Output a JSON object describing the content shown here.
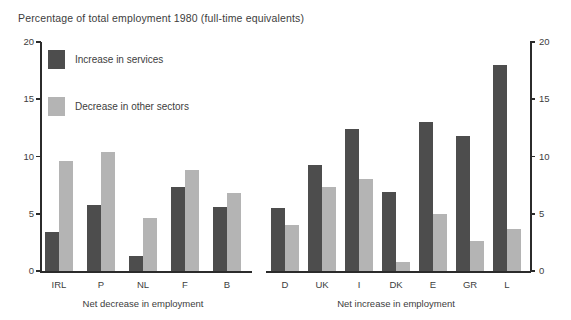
{
  "chart_data": {
    "type": "bar",
    "title": "Percentage of total employment 1980 (full-time equivalents)",
    "xlabel": "",
    "ylabel": "",
    "ylim": [
      0,
      20
    ],
    "yticks": [
      0,
      5,
      10,
      15,
      20
    ],
    "ytick_labels": [
      "0",
      "5",
      "10",
      "15",
      "20"
    ],
    "grid": false,
    "legend_position": "top-left-inside",
    "dual_y_axis": true,
    "categories": [
      "IRL",
      "P",
      "NL",
      "F",
      "B",
      "D",
      "UK",
      "I",
      "DK",
      "E",
      "GR",
      "L"
    ],
    "series": [
      {
        "name": "Increase in services",
        "color": "#4d4d4d",
        "values": [
          3.4,
          5.8,
          1.3,
          7.3,
          5.6,
          5.5,
          9.3,
          12.4,
          6.9,
          13.0,
          11.8,
          18.0
        ]
      },
      {
        "name": "Decrease in other sectors",
        "color": "#b4b4b4",
        "values": [
          9.6,
          10.4,
          4.6,
          8.8,
          6.8,
          4.0,
          7.3,
          8.0,
          0.8,
          5.0,
          2.6,
          3.7
        ]
      }
    ],
    "groups": [
      {
        "label": "Net decrease in employment",
        "categories": [
          "IRL",
          "P",
          "NL",
          "F",
          "B"
        ]
      },
      {
        "label": "Net increase in employment",
        "categories": [
          "D",
          "UK",
          "I",
          "DK",
          "E",
          "GR",
          "L"
        ]
      }
    ]
  },
  "legend": {
    "items": [
      {
        "label": "Increase in services",
        "color": "#4d4d4d"
      },
      {
        "label": "Decrease in other sectors",
        "color": "#b4b4b4"
      }
    ]
  },
  "axis": {
    "left_labels": [
      "20",
      "15",
      "10",
      "5",
      "0"
    ],
    "right_labels": [
      "20",
      "15",
      "10",
      "5",
      "0"
    ]
  }
}
